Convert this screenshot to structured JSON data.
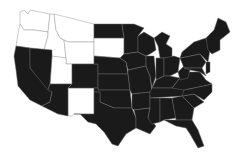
{
  "map": {
    "title": "",
    "region": "Contiguous United States",
    "colors": {
      "highlighted": "#1a1a1a",
      "not_highlighted": "#ffffff",
      "border": "#8a8a8a"
    },
    "states": [
      {
        "id": "WA",
        "fill": "white",
        "points": "20,12 24,10 28,14 30,10 50,14 48,32 34,30 24,30 20,24"
      },
      {
        "id": "OR",
        "fill": "white",
        "points": "20,24 24,30 34,30 48,32 48,36 44,50 16,46 18,34"
      },
      {
        "id": "ID",
        "fill": "white",
        "points": "50,14 54,14 56,30 60,38 64,40 66,58 44,56 44,50 48,36 48,32"
      },
      {
        "id": "MT",
        "fill": "white",
        "points": "54,14 94,24 94,42 68,42 64,40 60,38 56,30"
      },
      {
        "id": "WY",
        "fill": "white",
        "points": "68,42 94,42 94,64 66,64 66,58 64,40"
      },
      {
        "id": "UT",
        "fill": "white",
        "points": "52,56 66,58 66,64 72,64 72,84 50,84"
      },
      {
        "id": "NM",
        "fill": "white",
        "points": "68,88 94,88 94,114 74,114 72,116 68,116"
      },
      {
        "id": "SD",
        "fill": "white",
        "points": "94,38 124,38 124,54 120,58 94,56"
      },
      {
        "id": "ND",
        "fill": "black",
        "points": "94,24 122,24 124,38 94,38"
      },
      {
        "id": "CA",
        "fill": "black",
        "points": "16,46 30,48 30,68 52,92 50,102 42,106 30,100 18,86 16,70 14,56"
      },
      {
        "id": "NV",
        "fill": "black",
        "points": "30,48 52,50 52,56 50,84 48,90 30,68"
      },
      {
        "id": "AZ",
        "fill": "black",
        "points": "50,84 72,84 68,88 68,116 58,114 42,106 50,102 52,92 48,90"
      },
      {
        "id": "CO",
        "fill": "black",
        "points": "72,64 98,64 98,88 68,88 72,84"
      },
      {
        "id": "NE",
        "fill": "black",
        "points": "94,56 120,58 126,62 128,74 98,74 98,64 94,64"
      },
      {
        "id": "KS",
        "fill": "black",
        "points": "98,74 128,74 130,90 98,90"
      },
      {
        "id": "OK",
        "fill": "black",
        "points": "94,88 98,88 98,90 130,90 132,108 114,108 100,102 100,92 94,92"
      },
      {
        "id": "TX",
        "fill": "black",
        "points": "94,92 100,92 100,102 114,108 132,108 136,118 136,128 126,134 118,146 112,144 104,132 96,124 88,122 80,114 74,114 94,114"
      },
      {
        "id": "MN",
        "fill": "black",
        "points": "122,24 134,24 144,28 138,36 138,52 124,54 124,38"
      },
      {
        "id": "IA",
        "fill": "black",
        "points": "124,54 138,52 146,56 146,66 128,70 126,62 120,58"
      },
      {
        "id": "MO",
        "fill": "black",
        "points": "128,70 146,66 150,76 152,92 132,94 130,90 128,74"
      },
      {
        "id": "AR",
        "fill": "black",
        "points": "132,94 150,92 150,108 134,110 132,108"
      },
      {
        "id": "LA",
        "fill": "black",
        "points": "134,110 150,108 148,118 156,126 150,134 136,128 136,118"
      },
      {
        "id": "WI",
        "fill": "black",
        "points": "138,36 144,32 154,38 156,50 150,54 146,56 138,52"
      },
      {
        "id": "IL",
        "fill": "black",
        "points": "146,56 154,56 156,76 152,88 150,76 146,66"
      },
      {
        "id": "MI",
        "fill": "black",
        "points": "154,38 162,32 170,36 166,44 172,48 172,58 160,58 158,46"
      },
      {
        "id": "IN",
        "fill": "black",
        "points": "156,58 164,58 164,76 156,80 156,76"
      },
      {
        "id": "OH",
        "fill": "black",
        "points": "164,58 174,56 180,58 178,72 170,76 164,76"
      },
      {
        "id": "KY",
        "fill": "black",
        "points": "152,88 156,80 164,76 170,76 180,78 172,88"
      },
      {
        "id": "TN",
        "fill": "black",
        "points": "150,92 152,88 172,88 188,88 184,96 150,98"
      },
      {
        "id": "MS",
        "fill": "black",
        "points": "150,98 160,98 160,122 152,124 148,118 150,108"
      },
      {
        "id": "AL",
        "fill": "black",
        "points": "160,98 172,98 176,118 164,120 160,122"
      },
      {
        "id": "GA",
        "fill": "black",
        "points": "172,98 182,96 194,108 192,120 176,120"
      },
      {
        "id": "FL",
        "fill": "black",
        "points": "164,120 192,120 198,130 204,146 198,148 190,134 186,128 176,126"
      },
      {
        "id": "SC",
        "fill": "black",
        "points": "182,96 194,94 204,102 194,108"
      },
      {
        "id": "NC",
        "fill": "black",
        "points": "184,90 212,84 212,92 204,100 194,94 182,96"
      },
      {
        "id": "VA",
        "fill": "black",
        "points": "172,88 180,78 190,72 200,72 206,80 212,84 184,90"
      },
      {
        "id": "WV",
        "fill": "black",
        "points": "178,72 184,66 190,70 188,78 180,80"
      },
      {
        "id": "PA",
        "fill": "black",
        "points": "180,58 200,54 206,62 202,68 184,68"
      },
      {
        "id": "NY",
        "fill": "black",
        "points": "182,52 194,42 206,38 210,50 208,62 200,54 180,58"
      },
      {
        "id": "MD",
        "fill": "black",
        "points": "184,68 202,68 206,76 200,72 190,70"
      },
      {
        "id": "NJ",
        "fill": "black",
        "points": "206,62 210,62 210,72 206,74"
      },
      {
        "id": "NE_NEW_ENGLAND",
        "fill": "black",
        "points": "206,38 214,30 218,18 226,22 230,32 220,40 220,50 212,54 208,50"
      }
    ]
  }
}
